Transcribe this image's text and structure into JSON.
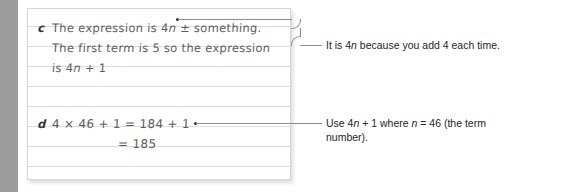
{
  "page": {
    "type": "worked-answer-notebook",
    "background_color": "#ffffff",
    "margin_bar_color": "#9c9c9c",
    "paper_color": "#ffffff",
    "rule_color": "#d9dde2",
    "handwriting_color": "#5c5c5c",
    "callout_color": "#231f20",
    "leader_color": "#8c8c8c"
  },
  "notebook": {
    "entries": [
      {
        "label": "c",
        "lines": [
          "The expression is 4n ± something.",
          "The first term is 5 so the expression",
          "is 4n + 1"
        ]
      },
      {
        "label": "d",
        "lines": [
          "4 × 46 + 1 = 184 + 1",
          "= 185"
        ]
      }
    ]
  },
  "callouts": [
    {
      "id": "callout-top",
      "text": "It is 4n because you add 4 each time.",
      "leader": "elbow"
    },
    {
      "id": "callout-bottom",
      "text": "Use 4n + 1 where n = 46 (the term number).",
      "leader": "straight"
    }
  ]
}
